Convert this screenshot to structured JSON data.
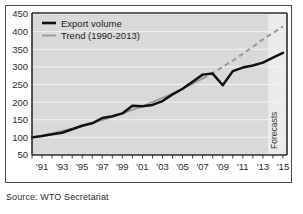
{
  "figure": {
    "caption": "Source: WTO Secretariat",
    "forecast_label": "Forecasts"
  },
  "legend": {
    "items": [
      {
        "label": "Export volume",
        "color": "#111111",
        "style": "solid",
        "width": 2.6
      },
      {
        "label": "Trend (1990-2013)",
        "color": "#9a9a9a",
        "style": "solid",
        "width": 1.8
      }
    ]
  },
  "colors": {
    "plot_background": "#d9d9d9",
    "forecast_background": "#ebebeb",
    "gridline": "#f2f2f2",
    "axis": "#2d2d2d",
    "export_line": "#111111",
    "trend_line": "#9a9a9a",
    "tick_label": "#2b2b2b"
  },
  "chart_data": {
    "type": "line",
    "title": "",
    "subtitle": "",
    "xlabel": "",
    "ylabel": "",
    "xlim": [
      1990,
      2015.4
    ],
    "ylim": [
      50,
      450
    ],
    "yticks": [
      50,
      100,
      150,
      200,
      250,
      300,
      350,
      400,
      450
    ],
    "ytick_labels": [
      "50",
      "100",
      "150",
      "200",
      "250",
      "300",
      "350",
      "400",
      "450"
    ],
    "xticks": [
      1990,
      1991,
      1992,
      1993,
      1994,
      1995,
      1996,
      1997,
      1998,
      1999,
      2000,
      2001,
      2002,
      2003,
      2004,
      2005,
      2006,
      2007,
      2008,
      2009,
      2010,
      2011,
      2012,
      2013,
      2014,
      2015
    ],
    "xtick_labels": [
      "",
      "'91",
      "",
      "'93",
      "",
      "'95",
      "",
      "'97",
      "",
      "'99",
      "",
      "'01",
      "",
      "'03",
      "",
      "'05",
      "",
      "'07",
      "",
      "'09",
      "",
      "'11",
      "",
      "'13",
      "",
      "'15"
    ],
    "grid": true,
    "grid_axis": "y",
    "legend_position": "top-left",
    "forecast_start": 2013.5,
    "annotations": [
      {
        "text": "Forecasts",
        "x": 2014.4,
        "rotation": -90
      }
    ],
    "x": [
      1990,
      1991,
      1992,
      1993,
      1994,
      1995,
      1996,
      1997,
      1998,
      1999,
      2000,
      2001,
      2002,
      2003,
      2004,
      2005,
      2006,
      2007,
      2008,
      2009,
      2010,
      2011,
      2012,
      2013,
      2014,
      2015
    ],
    "series": [
      {
        "name": "Export volume",
        "color": "#111111",
        "style": "solid",
        "values": [
          100,
          104,
          109,
          113,
          123,
          133,
          140,
          155,
          160,
          168,
          190,
          188,
          192,
          203,
          222,
          238,
          258,
          278,
          281,
          248,
          288,
          298,
          304,
          312,
          326,
          340
        ]
      },
      {
        "name": "Trend (1990-2013)",
        "color": "#9a9a9a",
        "style": "solid-then-dashed",
        "dash_start": 2007,
        "values": [
          99,
          105,
          111,
          118,
          125,
          133,
          141,
          149,
          158,
          168,
          178,
          188,
          200,
          212,
          224,
          238,
          252,
          267,
          283,
          300,
          318,
          337,
          357,
          378,
          396,
          415
        ]
      }
    ]
  }
}
